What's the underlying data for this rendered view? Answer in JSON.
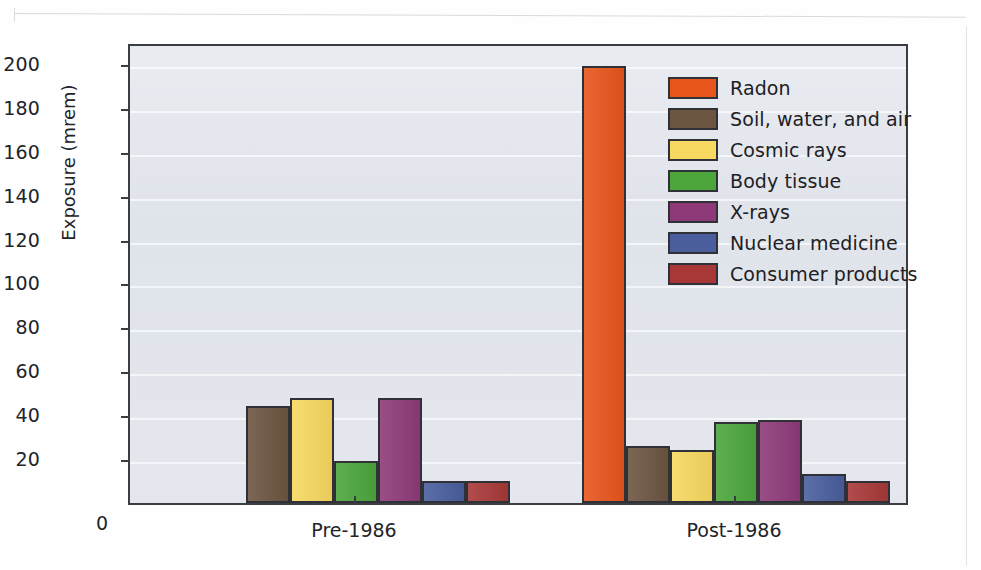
{
  "chart_data": {
    "type": "bar",
    "title": "",
    "xlabel": "",
    "ylabel": "Exposure (mrem)",
    "categories": [
      "Pre-1986",
      "Post-1986"
    ],
    "ylim": [
      0,
      210
    ],
    "yticks": [
      0,
      20,
      40,
      60,
      80,
      100,
      120,
      140,
      160,
      180,
      200
    ],
    "ytick_labels": [
      "0",
      "20",
      "40",
      "60",
      "80",
      "100",
      "120",
      "140",
      "160",
      "180",
      "200"
    ],
    "grid": true,
    "legend_position": "upper right",
    "series": [
      {
        "name": "Radon",
        "color": "#e8551c",
        "values": [
          0,
          199
        ]
      },
      {
        "name": "Soil, water, and air",
        "color": "#6b5540",
        "values": [
          44,
          26
        ]
      },
      {
        "name": "Cosmic rays",
        "color": "#f7d860",
        "values": [
          48,
          24
        ]
      },
      {
        "name": "Body tissue",
        "color": "#4ca63c",
        "values": [
          19,
          37
        ]
      },
      {
        "name": "X-rays",
        "color": "#8e3a78",
        "values": [
          48,
          38
        ]
      },
      {
        "name": "Nuclear medicine",
        "color": "#4a5e9e",
        "values": [
          10,
          13
        ]
      },
      {
        "name": "Consumer products",
        "color": "#a83838",
        "values": [
          10,
          10
        ]
      }
    ]
  },
  "axis": {
    "y_title": "Exposure (mrem)",
    "zero_label": "0"
  },
  "legend": {
    "items": [
      {
        "label": "Radon"
      },
      {
        "label": "Soil, water, and air"
      },
      {
        "label": "Cosmic rays"
      },
      {
        "label": "Body tissue"
      },
      {
        "label": "X-rays"
      },
      {
        "label": "Nuclear medicine"
      },
      {
        "label": "Consumer products"
      }
    ]
  },
  "colors": {
    "plot_background": "#dfe3ea",
    "gridline": "#f4f6f9",
    "axis": "#3a3d42",
    "page_background": "#fefefe"
  }
}
